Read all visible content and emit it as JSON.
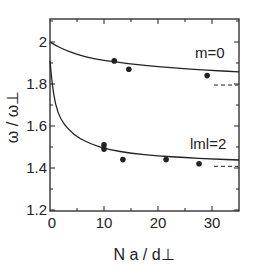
{
  "chart_data": {
    "type": "scatter",
    "title": "",
    "xlabel": "N a / d⊥",
    "ylabel": "ω / ω⊥",
    "xlim": [
      0,
      35
    ],
    "ylim": [
      1.2,
      2.11
    ],
    "xticks": [
      0,
      10,
      20,
      30
    ],
    "xtick_labels": [
      "0",
      "10",
      "20",
      "30"
    ],
    "yticks": [
      1.2,
      1.4,
      1.6,
      1.8,
      2.0
    ],
    "ytick_labels": [
      "1.2",
      "1.4",
      "1.6",
      "1.8",
      "2"
    ],
    "grid": false,
    "legend": "none",
    "series": [
      {
        "name": "m=0",
        "label": "m=0",
        "points": [
          {
            "x": 11.9,
            "y": 1.91
          },
          {
            "x": 14.6,
            "y": 1.87
          },
          {
            "x": 29.1,
            "y": 1.84
          }
        ],
        "curve": [
          {
            "x": 0,
            "y": 2.0
          },
          {
            "x": 1,
            "y": 1.985
          },
          {
            "x": 2.5,
            "y": 1.965
          },
          {
            "x": 5,
            "y": 1.94
          },
          {
            "x": 8,
            "y": 1.92
          },
          {
            "x": 12,
            "y": 1.905
          },
          {
            "x": 17,
            "y": 1.89
          },
          {
            "x": 23,
            "y": 1.876
          },
          {
            "x": 29,
            "y": 1.866
          },
          {
            "x": 35,
            "y": 1.858
          }
        ],
        "asymptote": {
          "y": 1.795,
          "x_from": 30,
          "x_to": 35
        }
      },
      {
        "name": "|m|=2",
        "label": "lml=2",
        "points": [
          {
            "x": 10.0,
            "y": 1.51
          },
          {
            "x": 10.0,
            "y": 1.49
          },
          {
            "x": 13.5,
            "y": 1.44
          },
          {
            "x": 21.5,
            "y": 1.44
          },
          {
            "x": 27.6,
            "y": 1.42
          }
        ],
        "curve": [
          {
            "x": 0,
            "y": 1.91
          },
          {
            "x": 0.4,
            "y": 1.8
          },
          {
            "x": 1,
            "y": 1.7
          },
          {
            "x": 2,
            "y": 1.63
          },
          {
            "x": 3.5,
            "y": 1.58
          },
          {
            "x": 5.5,
            "y": 1.54
          },
          {
            "x": 8,
            "y": 1.51
          },
          {
            "x": 11,
            "y": 1.487
          },
          {
            "x": 15,
            "y": 1.47
          },
          {
            "x": 20,
            "y": 1.458
          },
          {
            "x": 25,
            "y": 1.449
          },
          {
            "x": 30,
            "y": 1.443
          },
          {
            "x": 35,
            "y": 1.438
          }
        ],
        "asymptote": {
          "y": 1.408,
          "x_from": 30,
          "x_to": 35
        }
      }
    ]
  },
  "colors": {
    "ink": "#222222",
    "background": "#ffffff"
  }
}
